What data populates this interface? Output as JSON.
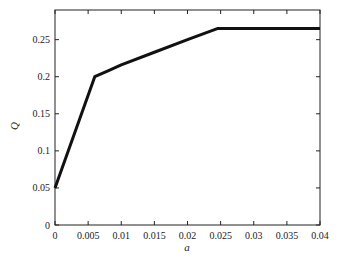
{
  "chart_data": {
    "type": "line",
    "title": "",
    "xlabel": "a",
    "ylabel": "Q",
    "xlim": [
      0,
      0.04
    ],
    "ylim": [
      0,
      0.29
    ],
    "grid": false,
    "legend": null,
    "x_ticks": [
      "0",
      "0.005",
      "0.01",
      "0.015",
      "0.02",
      "0.025",
      "0.03",
      "0.035",
      "0.04"
    ],
    "y_ticks": [
      "0",
      "0.05",
      "0.1",
      "0.15",
      "0.2",
      "0.25"
    ],
    "series": [
      {
        "name": "Q",
        "x": [
          0,
          0.006,
          0.008,
          0.01,
          0.015,
          0.02,
          0.0245,
          0.03,
          0.035,
          0.04
        ],
        "y": [
          0.05,
          0.2,
          0.208,
          0.216,
          0.233,
          0.25,
          0.265,
          0.265,
          0.265,
          0.265
        ]
      }
    ]
  }
}
